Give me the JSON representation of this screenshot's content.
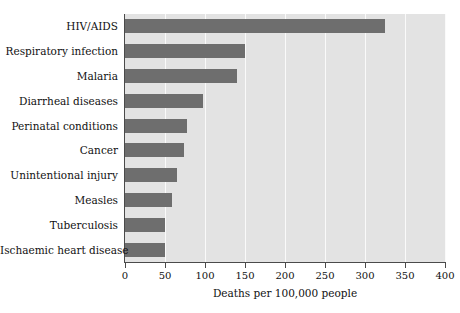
{
  "chart_data": {
    "type": "bar",
    "orientation": "horizontal",
    "title": "",
    "xlabel": "Deaths per 100,000 people",
    "ylabel": "",
    "xlim": [
      0,
      400
    ],
    "xticks": [
      0,
      50,
      100,
      150,
      200,
      250,
      300,
      350,
      400
    ],
    "xtick_labels": [
      "0",
      "50",
      "100",
      "150",
      "200",
      "250",
      "300",
      "350",
      "400"
    ],
    "grid": "vertical-only",
    "legend": "none",
    "categories": [
      "HIV/AIDS",
      "Respiratory infection",
      "Malaria",
      "Diarrheal diseases",
      "Perinatal conditions",
      "Cancer",
      "Unintentional injury",
      "Measles",
      "Tuberculosis",
      "Ischaemic heart disease"
    ],
    "values": [
      325,
      150,
      140,
      98,
      77,
      74,
      65,
      59,
      50,
      50
    ],
    "colors": {
      "bar": "#6e6e6e",
      "plot_background": "#e3e3e3",
      "gridline": "#fafafa",
      "axis": "#4a4a4a",
      "text": "#111111",
      "page_background": "#ffffff"
    }
  }
}
